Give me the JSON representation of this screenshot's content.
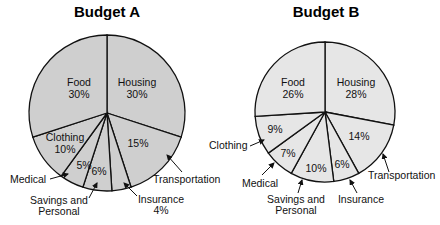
{
  "chart_data": [
    {
      "type": "pie",
      "title": "Budget A",
      "fill": "#cfcfcf",
      "categories": [
        "Housing",
        "Transportation",
        "Insurance",
        "Savings and Personal",
        "Medical",
        "Clothing",
        "Food"
      ],
      "values": [
        30,
        15,
        4,
        6,
        5,
        10,
        30
      ],
      "labels": {
        "housing": [
          "Housing",
          "30%"
        ],
        "transportation": [
          "15%",
          "Transportation"
        ],
        "insurance": [
          "Insurance",
          "4%"
        ],
        "savings": [
          "6%",
          "Savings and",
          "Personal"
        ],
        "medical": [
          "5%",
          "Medical"
        ],
        "clothing": [
          "Clothing",
          "10%"
        ],
        "food": [
          "Food",
          "30%"
        ]
      }
    },
    {
      "type": "pie",
      "title": "Budget B",
      "fill": "#e6e6e6",
      "categories": [
        "Housing",
        "Transportation",
        "Insurance",
        "Savings and Personal",
        "Medical",
        "Clothing",
        "Food"
      ],
      "values": [
        28,
        14,
        6,
        10,
        7,
        9,
        26
      ],
      "labels": {
        "housing": [
          "Housing",
          "28%"
        ],
        "transportation": [
          "14%",
          "Transportation"
        ],
        "insurance": [
          "6%",
          "Insurance"
        ],
        "savings": [
          "10%",
          "Savings and",
          "Personal"
        ],
        "medical": [
          "7%",
          "Medical"
        ],
        "clothing": [
          "9%",
          "Clothing"
        ],
        "food": [
          "Food",
          "26%"
        ]
      }
    }
  ]
}
